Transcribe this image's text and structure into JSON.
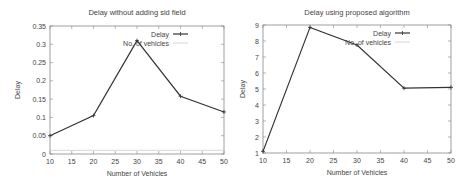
{
  "chart_data": [
    {
      "type": "line",
      "title": "Delay without adding sid field",
      "xlabel": "Number of Vehicles",
      "ylabel": "Delay",
      "xlim": [
        10,
        50
      ],
      "ylim": [
        0,
        0.35
      ],
      "xticks": [
        "10",
        "15",
        "20",
        "25",
        "30",
        "35",
        "40",
        "45",
        "50"
      ],
      "yticks": [
        "0",
        "0.05",
        "0.1",
        "0.15",
        "0.2",
        "0.25",
        "0.3",
        "0.35"
      ],
      "grid": false,
      "legend_position": "top-right",
      "series": [
        {
          "name": "Delay",
          "x": [
            10,
            20,
            30,
            40,
            50
          ],
          "values": [
            0.05,
            0.105,
            0.31,
            0.158,
            0.115
          ],
          "color": "#333333"
        },
        {
          "name": "No. of vehicles",
          "x": [
            10,
            20,
            30,
            40,
            50
          ],
          "values": [
            0.01,
            0.01,
            0.01,
            0.01,
            0.01
          ],
          "color": "#cccccc"
        }
      ]
    },
    {
      "type": "line",
      "title": "Delay using proposed algorithm",
      "xlabel": "Number of Vehicles",
      "ylabel": "Delay",
      "xlim": [
        10,
        50
      ],
      "ylim": [
        1,
        9
      ],
      "xticks": [
        "10",
        "15",
        "20",
        "25",
        "30",
        "35",
        "40",
        "45",
        "50"
      ],
      "yticks": [
        "1",
        "2",
        "3",
        "4",
        "5",
        "6",
        "7",
        "8",
        "9"
      ],
      "grid": false,
      "legend_position": "top-right",
      "series": [
        {
          "name": "Delay",
          "x": [
            10,
            20,
            30,
            40,
            50
          ],
          "values": [
            1.1,
            8.85,
            7.75,
            5.05,
            5.1
          ],
          "color": "#333333"
        },
        {
          "name": "No. of vehicles",
          "x": [],
          "values": [],
          "color": "#cccccc"
        }
      ]
    }
  ],
  "legend": {
    "delay_label": "Delay",
    "vehicles_label": "No. of vehicles"
  }
}
